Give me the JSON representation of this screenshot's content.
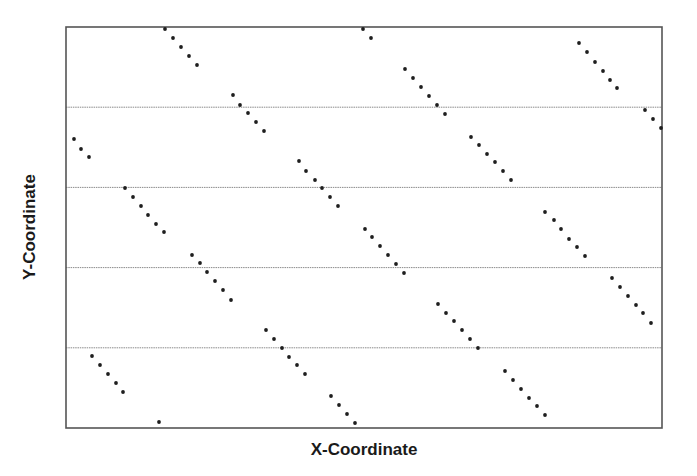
{
  "chart_data": {
    "type": "scatter",
    "title": "",
    "xlabel": "X-Coordinate",
    "ylabel": "Y-Coordinate",
    "xlim": [
      0,
      1
    ],
    "ylim": [
      0,
      5
    ],
    "x_ticks": [],
    "y_ticks": [],
    "grid": {
      "horizontal": true,
      "vertical": false,
      "y_lines": [
        1,
        2,
        3,
        4
      ]
    },
    "legend": null,
    "colors": {
      "marker": "#1e1e1e",
      "frame": "#555555",
      "grid": "#8a8a8a"
    },
    "plot_frame_px": {
      "left": 66,
      "top": 27,
      "right": 662,
      "bottom": 428
    },
    "series": [
      {
        "name": "points",
        "points_px": [
          [
            165,
            29
          ],
          [
            173,
            38
          ],
          [
            181,
            47
          ],
          [
            189,
            56
          ],
          [
            197,
            65
          ],
          [
            233,
            95
          ],
          [
            240,
            105
          ],
          [
            248,
            113
          ],
          [
            256,
            122
          ],
          [
            264,
            131
          ],
          [
            74,
            139
          ],
          [
            81,
            149
          ],
          [
            89,
            157
          ],
          [
            299,
            161
          ],
          [
            306,
            171
          ],
          [
            315,
            180
          ],
          [
            322,
            188
          ],
          [
            330,
            197
          ],
          [
            338,
            206
          ],
          [
            125,
            188
          ],
          [
            133,
            197
          ],
          [
            141,
            206
          ],
          [
            148,
            215
          ],
          [
            156,
            224
          ],
          [
            164,
            232
          ],
          [
            192,
            255
          ],
          [
            200,
            263
          ],
          [
            207,
            272
          ],
          [
            215,
            281
          ],
          [
            223,
            290
          ],
          [
            231,
            300
          ],
          [
            266,
            330
          ],
          [
            274,
            339
          ],
          [
            282,
            348
          ],
          [
            289,
            357
          ],
          [
            297,
            365
          ],
          [
            305,
            374
          ],
          [
            331,
            396
          ],
          [
            339,
            405
          ],
          [
            347,
            414
          ],
          [
            355,
            423
          ],
          [
            92,
            356
          ],
          [
            100,
            365
          ],
          [
            108,
            374
          ],
          [
            116,
            383
          ],
          [
            123,
            392
          ],
          [
            159,
            422
          ],
          [
            363,
            29
          ],
          [
            371,
            38
          ],
          [
            405,
            69
          ],
          [
            413,
            78
          ],
          [
            421,
            87
          ],
          [
            429,
            96
          ],
          [
            437,
            105
          ],
          [
            445,
            114
          ],
          [
            471,
            137
          ],
          [
            479,
            145
          ],
          [
            487,
            154
          ],
          [
            495,
            162
          ],
          [
            503,
            171
          ],
          [
            511,
            180
          ],
          [
            579,
            43
          ],
          [
            587,
            52
          ],
          [
            595,
            62
          ],
          [
            603,
            71
          ],
          [
            610,
            80
          ],
          [
            617,
            88
          ],
          [
            645,
            110
          ],
          [
            653,
            119
          ],
          [
            661,
            128
          ],
          [
            365,
            229
          ],
          [
            372,
            237
          ],
          [
            380,
            246
          ],
          [
            388,
            255
          ],
          [
            396,
            264
          ],
          [
            404,
            273
          ],
          [
            545,
            212
          ],
          [
            554,
            220
          ],
          [
            561,
            229
          ],
          [
            569,
            239
          ],
          [
            577,
            247
          ],
          [
            585,
            256
          ],
          [
            612,
            278
          ],
          [
            620,
            287
          ],
          [
            628,
            296
          ],
          [
            636,
            305
          ],
          [
            643,
            313
          ],
          [
            651,
            323
          ],
          [
            438,
            304
          ],
          [
            446,
            313
          ],
          [
            454,
            321
          ],
          [
            462,
            330
          ],
          [
            470,
            339
          ],
          [
            478,
            348
          ],
          [
            505,
            371
          ],
          [
            513,
            380
          ],
          [
            521,
            389
          ],
          [
            529,
            398
          ],
          [
            537,
            406
          ],
          [
            545,
            415
          ]
        ]
      }
    ]
  }
}
